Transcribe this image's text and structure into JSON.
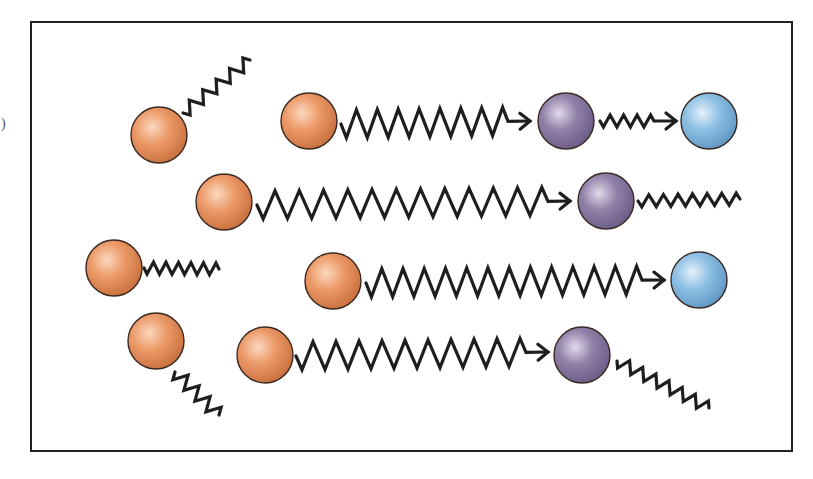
{
  "canvas": {
    "width": 813,
    "height": 479,
    "background": "#ffffff"
  },
  "frame": {
    "x": 31,
    "y": 22,
    "width": 761,
    "height": 429,
    "stroke": "#222222",
    "stroke_width": 2
  },
  "colors": {
    "orange": {
      "base": "#ec9a68",
      "light": "#fbd8bf",
      "dark": "#c8703e"
    },
    "purple": {
      "base": "#9182aa",
      "light": "#e2daea",
      "dark": "#6a5c86"
    },
    "blue": {
      "base": "#8ec0e4",
      "light": "#e4f1fa",
      "dark": "#5f97c4"
    },
    "wave": "#1e1e1e",
    "outline": "#3a2a22"
  },
  "particles": [
    {
      "id": "orange-1",
      "type": "orange",
      "cx": 159,
      "cy": 135,
      "r": 28
    },
    {
      "id": "orange-2",
      "type": "orange",
      "cx": 309,
      "cy": 121,
      "r": 28
    },
    {
      "id": "purple-1",
      "type": "purple",
      "cx": 566,
      "cy": 121,
      "r": 28
    },
    {
      "id": "blue-1",
      "type": "blue",
      "cx": 709,
      "cy": 121,
      "r": 28
    },
    {
      "id": "orange-3",
      "type": "orange",
      "cx": 224,
      "cy": 202,
      "r": 28
    },
    {
      "id": "purple-2",
      "type": "purple",
      "cx": 606,
      "cy": 201,
      "r": 28
    },
    {
      "id": "orange-4",
      "type": "orange",
      "cx": 114,
      "cy": 268,
      "r": 28
    },
    {
      "id": "orange-5",
      "type": "orange",
      "cx": 333,
      "cy": 281,
      "r": 28
    },
    {
      "id": "blue-2",
      "type": "blue",
      "cx": 699,
      "cy": 280,
      "r": 28
    },
    {
      "id": "orange-6",
      "type": "orange",
      "cx": 156,
      "cy": 341,
      "r": 28
    },
    {
      "id": "orange-7",
      "type": "orange",
      "cx": 265,
      "cy": 355,
      "r": 28
    },
    {
      "id": "purple-3",
      "type": "purple",
      "cx": 582,
      "cy": 355,
      "r": 28
    }
  ],
  "waves": [
    {
      "id": "wave-o1-emit",
      "x1": 183,
      "y1": 113,
      "x2": 250,
      "y2": 60,
      "cycles": 5,
      "amp": 6,
      "arrow": false
    },
    {
      "id": "wave-o2-p1",
      "x1": 341,
      "y1": 124,
      "x2": 530,
      "y2": 121,
      "cycles": 8,
      "amp": 14,
      "arrow": true
    },
    {
      "id": "wave-p1-b1",
      "x1": 600,
      "y1": 121,
      "x2": 676,
      "y2": 121,
      "cycles": 4,
      "amp": 6,
      "arrow": true
    },
    {
      "id": "wave-o3-p2",
      "x1": 257,
      "y1": 205,
      "x2": 570,
      "y2": 201,
      "cycles": 12,
      "amp": 14,
      "arrow": true
    },
    {
      "id": "wave-p2-emit",
      "x1": 638,
      "y1": 201,
      "x2": 740,
      "y2": 199,
      "cycles": 7,
      "amp": 6,
      "arrow": false
    },
    {
      "id": "wave-o4-emit",
      "x1": 144,
      "y1": 268,
      "x2": 219,
      "y2": 269,
      "cycles": 6,
      "amp": 6,
      "arrow": false
    },
    {
      "id": "wave-o5-b2",
      "x1": 366,
      "y1": 283,
      "x2": 664,
      "y2": 280,
      "cycles": 13,
      "amp": 14,
      "arrow": true
    },
    {
      "id": "wave-o6-emit",
      "x1": 175,
      "y1": 372,
      "x2": 219,
      "y2": 415,
      "cycles": 4,
      "amp": 7,
      "arrow": false
    },
    {
      "id": "wave-o7-p3",
      "x1": 296,
      "y1": 356,
      "x2": 548,
      "y2": 352,
      "cycles": 10,
      "amp": 14,
      "arrow": true
    },
    {
      "id": "wave-p3-emit",
      "x1": 617,
      "y1": 361,
      "x2": 709,
      "y2": 408,
      "cycles": 7,
      "amp": 6,
      "arrow": false
    }
  ],
  "margin_mark": {
    "x": 1,
    "y": 128,
    "text": ")"
  }
}
